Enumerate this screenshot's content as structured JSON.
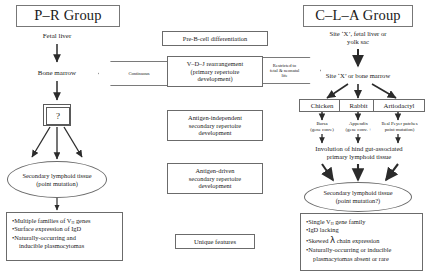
{
  "figure": {
    "type": "flow-diagram"
  },
  "left_group": {
    "title": "P–R Group",
    "nodes": {
      "fetal_liver": "Fetal liver",
      "bone_marrow": "Bone marrow",
      "question": "?",
      "secondary": "Secondary lymphoid tissue",
      "secondary_sub": "(point mutation)"
    },
    "features": {
      "b1": "Multiple families of V",
      "b1_sub": "H",
      "b1_tail": " genes",
      "b2": "Surface expression of IgD",
      "b3": "Naturally-occurring and",
      "b3_cont": "inducible plasmocytomas"
    }
  },
  "middle_column": {
    "pre_b": "Pre-B-cell differentiation",
    "vdj_l1": "V–D–J rearrangement",
    "vdj_l2": "(primary repertoire",
    "vdj_l3": "development)",
    "ag_indep_l1": "Antigen-independent",
    "ag_indep_l2": "secondary repertoire",
    "ag_indep_l3": "development",
    "ag_driven_l1": "Antigen-driven",
    "ag_driven_l2": "secondary repertoire",
    "ag_driven_l3": "development",
    "unique": "Unique features"
  },
  "callouts": {
    "continuous": "Continuous",
    "restricted_l1": "Restricted to",
    "restricted_l2": "fetal & neonatal",
    "restricted_l3": "life"
  },
  "right_group": {
    "title": "C–L–A Group",
    "nodes": {
      "site_x_l1": "Site ‘X’, fetal liver or",
      "site_x_l2": "yolk sac",
      "site_x_bm": "Site ‘X’ or bone marrow",
      "chicken": "Chicken",
      "rabbit": "Rabbit",
      "artiodactyl": "Artiodactyl",
      "chicken_organ": "Bursa",
      "chicken_mech": "(gene conv.)",
      "rabbit_organ": "Appendix",
      "rabbit_mech": "(gene conv. +",
      "artiodactyl_organ": "Ileal Peyer patches",
      "artiodactyl_mech": "point mutation)",
      "involution_l1": "Involution of hind gut-associated",
      "involution_l2": "primary lymphoid tissue",
      "secondary": "Secondary lymphoid tissue",
      "secondary_sub": "(point mutation?)"
    },
    "features": {
      "b1": "Single V",
      "b1_sub": "H",
      "b1_tail": " gene family",
      "b2": "IgD lacking",
      "b3a": "Skewed ",
      "b3_sym": "λ",
      "b3b": " chain expression",
      "b4": "Naturally-occurring or inducible",
      "b4_cont": "plasmacytomas absent or rare"
    }
  },
  "colors": {
    "ink": "#1a1a1a",
    "stroke": "#6b6b6b",
    "background": "#ffffff"
  }
}
